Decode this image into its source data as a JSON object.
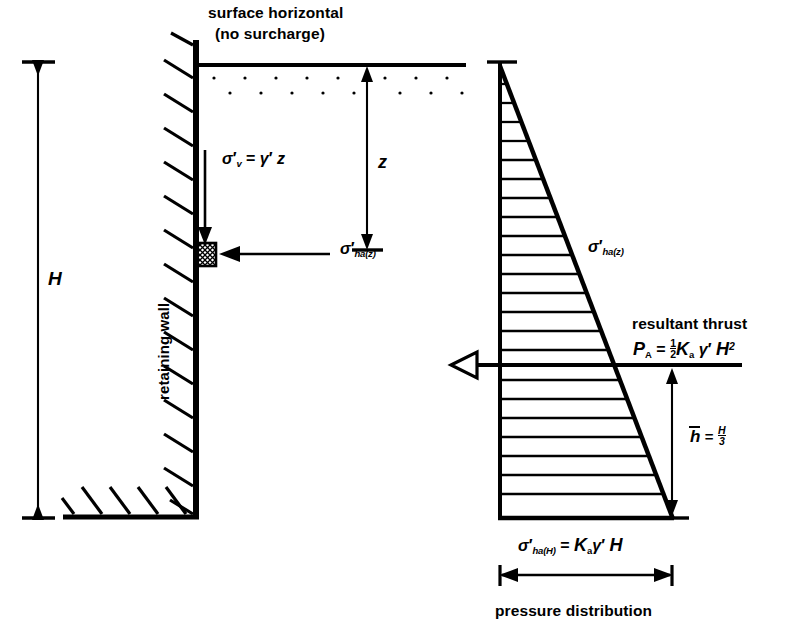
{
  "figure": {
    "domain": "engineering-diagram",
    "background": "#ffffff",
    "ink": "#000000"
  },
  "labels": {
    "surface_line1": "surface horizontal",
    "surface_line2": "(no surcharge)",
    "retaining_wall": "retaining wall",
    "resultant_thrust": "resultant thrust",
    "pressure_distribution": "pressure distribution",
    "H": "H",
    "z": "z",
    "sigma": "σ",
    "prime": "′",
    "sub_v": "v",
    "sub_ha_z": "ha(z)",
    "sub_ha_H": "ha(H)",
    "equals": "=",
    "gamma": "γ",
    "K": "K",
    "sub_a": "a",
    "P": "P",
    "sub_A": "A",
    "half_num": "1",
    "half_den": "2",
    "H_over_3_num": "H",
    "H_over_3_den": "3",
    "exp_2": "2",
    "h_bar": "h"
  },
  "equations": {
    "vertical_stress": "σ'v = γ' z",
    "horizontal_stress_z": "σ'ha(z)",
    "resultant": "PA = ½ Ka γ' H²",
    "horizontal_stress_H": "σ'ha(H) = Ka γ' H"
  },
  "geometry": {
    "wall_face_x": 196,
    "wall_top_y": 40,
    "wall_base_y": 517,
    "ground_line_y": 65,
    "ground_line_x1": 196,
    "ground_line_x2": 465,
    "H_dim_x": 38,
    "H_top_y": 62,
    "H_bot_y": 518,
    "z_dim_x": 367,
    "z_top_y": 66,
    "z_bot_y": 250,
    "element_x": 196,
    "element_y": 243,
    "element_w": 19,
    "element_h": 22,
    "tri_apex_x": 500,
    "tri_apex_y": 65,
    "tri_base_y": 518,
    "tri_base_x2": 672,
    "hatch_count": 24,
    "thrust_y": 365,
    "thrust_x_left": 452,
    "thrust_x_right": 740,
    "hbar_x": 672,
    "hbar_top_y": 368,
    "hbar_bot_y": 518,
    "width_dim_y": 575,
    "width_x1": 500,
    "width_x2": 672
  }
}
